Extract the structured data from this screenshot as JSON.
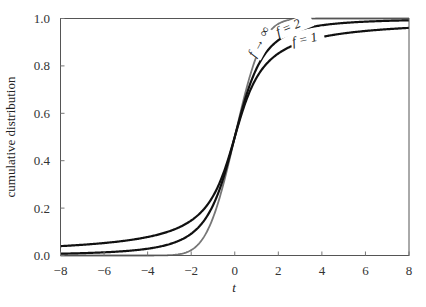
{
  "chart_data": {
    "type": "line",
    "title": "",
    "xlabel": "t",
    "ylabel": "cumulative distribution",
    "xlim": [
      -8,
      8
    ],
    "ylim": [
      0,
      1
    ],
    "xticks": [
      -8,
      -6,
      -4,
      -2,
      0,
      2,
      4,
      6,
      8
    ],
    "xtick_labels": [
      "−8",
      "−6",
      "−4",
      "−2",
      "0",
      "2",
      "4",
      "6",
      "8"
    ],
    "yticks": [
      0.0,
      0.2,
      0.4,
      0.6,
      0.8,
      1.0
    ],
    "ytick_labels": [
      "0.0",
      "0.2",
      "0.4",
      "0.6",
      "0.8",
      "1.0"
    ],
    "grid": false,
    "legend": "inline labels near top-right of curves",
    "x": [
      -8,
      -6,
      -4,
      -3,
      -2,
      -1.5,
      -1,
      -0.5,
      0,
      0.5,
      1,
      1.5,
      2,
      3,
      4,
      6,
      8
    ],
    "series": [
      {
        "name": "f = 1",
        "label": "f = 1",
        "color": "#111111",
        "values": [
          0.04,
          0.053,
          0.078,
          0.102,
          0.148,
          0.187,
          0.25,
          0.352,
          0.5,
          0.648,
          0.75,
          0.813,
          0.852,
          0.898,
          0.922,
          0.947,
          0.96
        ]
      },
      {
        "name": "f = 2",
        "label": "f = 2",
        "color": "#111111",
        "values": [
          0.015,
          0.026,
          0.029,
          0.048,
          0.092,
          0.138,
          0.211,
          0.333,
          0.5,
          0.667,
          0.789,
          0.862,
          0.908,
          0.952,
          0.971,
          0.987,
          0.985
        ]
      },
      {
        "name": "f → ∞",
        "label": "f → ∞",
        "color": "#777777",
        "values": [
          0.0,
          0.0,
          0.0,
          0.001,
          0.023,
          0.067,
          0.159,
          0.309,
          0.5,
          0.691,
          0.841,
          0.933,
          0.977,
          0.999,
          1.0,
          1.0,
          1.0
        ]
      }
    ]
  }
}
